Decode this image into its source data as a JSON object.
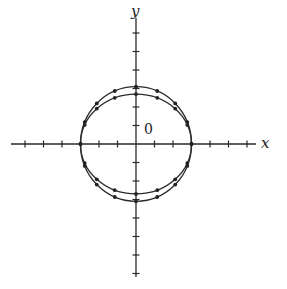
{
  "diagram": {
    "type": "coordinate-plot",
    "axes": {
      "x_label": "x",
      "y_label": "y",
      "origin_label": "0",
      "x_ticks": [
        -7,
        -6,
        -5,
        -4,
        -3,
        -2,
        -1,
        1,
        2,
        3,
        4,
        5,
        6,
        7
      ],
      "y_ticks": [
        -7,
        -6,
        -5,
        -4,
        -3,
        -2,
        -1,
        1,
        2,
        3,
        4,
        5,
        6,
        7
      ],
      "x_range": [
        -6.8,
        6.5
      ],
      "y_range": [
        -7.1,
        6.8
      ]
    },
    "curves": [
      {
        "name": "outer-curve",
        "semi_axis_x": 3.0,
        "semi_axis_y": 3.1,
        "marked_points": 16
      },
      {
        "name": "inner-curve",
        "semi_axis_x": 3.0,
        "semi_axis_y": 2.7,
        "marked_points": 16
      }
    ],
    "colors": {
      "line": "#2a2a2a",
      "background": "#ffffff"
    }
  }
}
